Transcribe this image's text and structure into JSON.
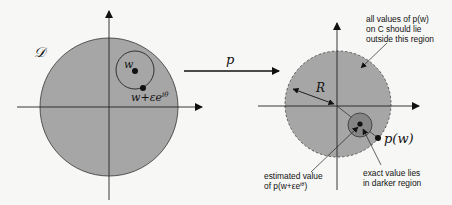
{
  "left_panel": {
    "domain_label": "𝒟",
    "point_w_label": "w",
    "point_perturbed_label": "w+εe",
    "point_perturbed_superscript": "iθ"
  },
  "mapping_arrow": {
    "label": "p"
  },
  "right_panel": {
    "radius_label": "R",
    "point_pw_label": "p(w)",
    "annotation_top": [
      "all values of p(w)",
      "on C should lie",
      "outside this region"
    ],
    "annotation_bottom_left": [
      "estimated value",
      "of p(w+εe",
      "iθ",
      ")"
    ],
    "annotation_bottom_right": [
      "exact value lies",
      "in darker region"
    ]
  },
  "colors": {
    "background": "#f7f7f5",
    "disk_fill": "#a6a6a6",
    "dark_region": "#858585",
    "line": "#222222"
  }
}
